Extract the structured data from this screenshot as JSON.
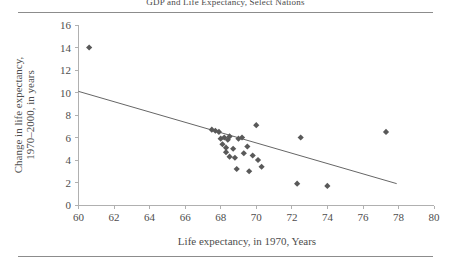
{
  "figure": {
    "top_rule": "rule",
    "bottom_rule": "rule"
  },
  "chart_data": {
    "type": "scatter",
    "title": "GDP and Life Expectancy, Select Nations",
    "xlabel": "Life expectancy, in 1970, Years",
    "ylabel_line1": "Change in life expectancy,",
    "ylabel_line2": "1970–2000, in years",
    "xlim": [
      60,
      80
    ],
    "ylim": [
      0,
      16
    ],
    "xticks": [
      60,
      62,
      64,
      66,
      68,
      70,
      72,
      74,
      76,
      78,
      80
    ],
    "yticks": [
      0,
      2,
      4,
      6,
      8,
      10,
      12,
      14,
      16
    ],
    "grid": false,
    "legend": "none",
    "marker": "diamond",
    "marker_color": "#595959",
    "trendline_color": "#666666",
    "axis_color": "#b0b0b0",
    "points": [
      {
        "x": 60.6,
        "y": 14.0
      },
      {
        "x": 67.5,
        "y": 6.7
      },
      {
        "x": 67.7,
        "y": 6.6
      },
      {
        "x": 67.9,
        "y": 6.5
      },
      {
        "x": 68.0,
        "y": 5.9
      },
      {
        "x": 68.1,
        "y": 5.4
      },
      {
        "x": 68.2,
        "y": 6.0
      },
      {
        "x": 68.3,
        "y": 5.1
      },
      {
        "x": 68.3,
        "y": 4.7
      },
      {
        "x": 68.4,
        "y": 5.8
      },
      {
        "x": 68.5,
        "y": 6.1
      },
      {
        "x": 68.5,
        "y": 4.3
      },
      {
        "x": 68.7,
        "y": 5.0
      },
      {
        "x": 68.8,
        "y": 4.2
      },
      {
        "x": 68.9,
        "y": 3.2
      },
      {
        "x": 69.0,
        "y": 5.9
      },
      {
        "x": 69.2,
        "y": 6.0
      },
      {
        "x": 69.3,
        "y": 4.6
      },
      {
        "x": 69.5,
        "y": 5.2
      },
      {
        "x": 69.6,
        "y": 3.0
      },
      {
        "x": 69.8,
        "y": 4.4
      },
      {
        "x": 70.0,
        "y": 7.1
      },
      {
        "x": 70.1,
        "y": 4.0
      },
      {
        "x": 70.3,
        "y": 3.4
      },
      {
        "x": 72.3,
        "y": 1.9
      },
      {
        "x": 72.5,
        "y": 6.0
      },
      {
        "x": 74.0,
        "y": 1.7
      },
      {
        "x": 77.3,
        "y": 6.5
      }
    ],
    "trendline": {
      "x1": 60.0,
      "y1": 10.1,
      "x2": 77.9,
      "y2": 1.9
    }
  }
}
